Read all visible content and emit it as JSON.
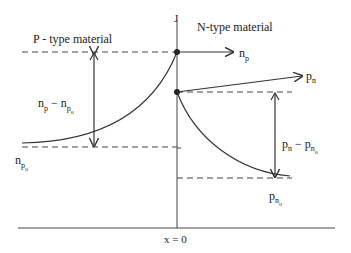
{
  "labels": {
    "junction": "J",
    "p_region": "P - type material",
    "n_region": "N-type material",
    "np_arrow": "n",
    "np_arrow_sub": "p",
    "pn_arrow": "p",
    "pn_arrow_sub": "n",
    "np_excess_main": "n",
    "np_excess_sub": "p",
    "np_excess_minus": " − ",
    "np_excess_main2": "n",
    "np_excess_sub2": "p",
    "np_excess_subsub2": "o",
    "npo_main": "n",
    "npo_sub": "p",
    "npo_subsub": "o",
    "pn_excess_main": "p",
    "pn_excess_sub": "n",
    "pn_excess_minus": " − ",
    "pn_excess_main2": "p",
    "pn_excess_sub2": "n",
    "pn_excess_subsub2": "o",
    "pno_main": "p",
    "pno_sub": "n",
    "pno_subsub": "o",
    "x_origin": "x = 0"
  },
  "colors": {
    "line": "#333333"
  }
}
